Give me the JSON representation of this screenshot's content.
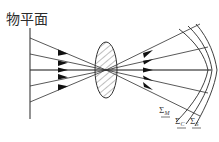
{
  "figure": {
    "width": 219,
    "height": 142,
    "background_color": "#ffffff",
    "stroke_color": "#333333",
    "title_text": "物平面"
  },
  "labels": {
    "object_plane": "物平面",
    "meridional_surface": "Σ",
    "meridional_subscript": "M",
    "circle_surface": "Σ",
    "circle_subscript": "C",
    "sagittal_surface": "Σ",
    "sagittal_subscript": "S"
  },
  "diagram_data": {
    "type": "ray-diagram",
    "object_plane": {
      "x": 30,
      "y_top": 28,
      "y_bottom": 119,
      "label": "物平面",
      "label_x": 6,
      "label_y": 14
    },
    "axis": {
      "y": 70,
      "x_start": 30,
      "x_end": 212
    },
    "lens": {
      "cx": 106,
      "cy": 70,
      "rx": 11,
      "ry": 28,
      "hatched": true,
      "hatch_spacing": 5
    },
    "focus": {
      "x": 106,
      "y": 70
    },
    "incoming_rays": [
      {
        "y_start": 38,
        "arrow_x": 63
      },
      {
        "y_start": 54,
        "arrow_x": 63
      },
      {
        "y_start": 70,
        "arrow_x": 63
      },
      {
        "y_start": 86,
        "arrow_x": 63
      },
      {
        "y_start": 102,
        "arrow_x": 63
      }
    ],
    "outgoing_rays": [
      {
        "y_end": 24,
        "arrow_x": 148
      },
      {
        "y_end": 47,
        "arrow_x": 148
      },
      {
        "y_end": 70,
        "arrow_x": 148
      },
      {
        "y_end": 93,
        "arrow_x": 148
      },
      {
        "y_end": 116,
        "arrow_x": 148
      }
    ],
    "image_surfaces": [
      {
        "name": "meridional",
        "label": "Σ",
        "subscript": "M",
        "label_x": 160,
        "label_y": 108,
        "curvature": "strong"
      },
      {
        "name": "circle-of-least-confusion",
        "label": "Σ",
        "subscript": "C",
        "label_x": 176,
        "label_y": 119,
        "curvature": "medium"
      },
      {
        "name": "sagittal",
        "label": "Σ",
        "subscript": "S",
        "label_x": 191,
        "label_y": 119,
        "curvature": "weak"
      }
    ]
  }
}
